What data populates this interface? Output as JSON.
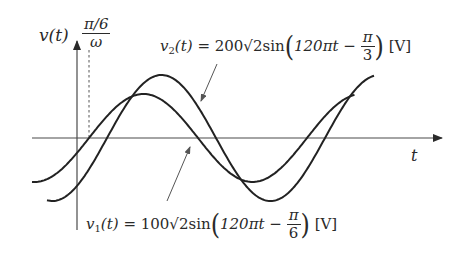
{
  "diagram": {
    "type": "sinusoidal waveform diagram",
    "axes": {
      "y_label": "v(t)",
      "x_label": "t"
    },
    "phase_marker": {
      "numerator": "π/6",
      "denominator": "ω"
    },
    "curves": [
      {
        "id": "v1",
        "name_var": "v",
        "name_sub": "1",
        "name_arg": "(t)",
        "equals": "=",
        "coefficient": "100√2sin",
        "argument": "120πt −",
        "phase_num": "π",
        "phase_den": "6",
        "unit": "[V]",
        "amplitude_px": 44,
        "phase_px": 0
      },
      {
        "id": "v2",
        "name_var": "v",
        "name_sub": "2",
        "name_arg": "(t)",
        "equals": "=",
        "coefficient": "200√2sin",
        "argument": "120πt −",
        "phase_num": "π",
        "phase_den": "3",
        "unit": "[V]",
        "amplitude_px": 63,
        "phase_px": 18
      }
    ]
  },
  "colors": {
    "ink": "#2a2a2a",
    "axis": "#4a4a4a",
    "background": "#ffffff"
  }
}
